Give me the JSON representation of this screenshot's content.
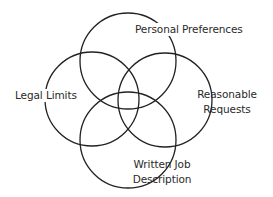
{
  "diagram": {
    "type": "venn",
    "stroke_color": "#222222",
    "background": "#ffffff",
    "circles": [
      {
        "name": "personal-preferences",
        "cx": 128,
        "cy": 61,
        "r": 48
      },
      {
        "name": "legal-limits",
        "cx": 92,
        "cy": 99,
        "r": 47
      },
      {
        "name": "reasonable-requests",
        "cx": 165,
        "cy": 100,
        "r": 47
      },
      {
        "name": "written-job-description",
        "cx": 128,
        "cy": 140,
        "r": 48
      }
    ],
    "labels": {
      "personal_preferences": "Personal Preferences",
      "legal_limits": "Legal Limits",
      "reasonable_requests_line1": "Reasonable",
      "reasonable_requests_line2": "Requests",
      "written_job_line1": "Written Job",
      "written_job_line2": "Description"
    }
  }
}
